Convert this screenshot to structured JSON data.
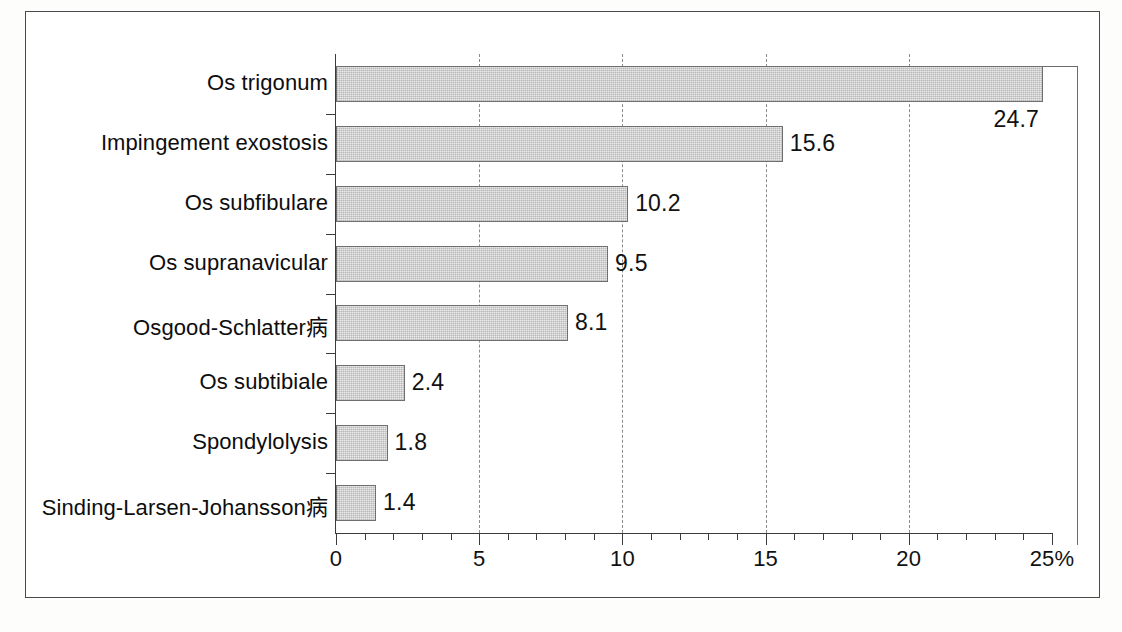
{
  "chart_data": {
    "type": "bar",
    "orientation": "horizontal",
    "title": "",
    "xlabel": "",
    "ylabel": "",
    "xlim": [
      0,
      25
    ],
    "grid": true,
    "gridlines_at": [
      5,
      10,
      15,
      20
    ],
    "legend": "none",
    "axis_unit_suffix": "%",
    "tick_labels": [
      "0",
      "5",
      "10",
      "15",
      "20",
      "25%"
    ],
    "tick_values": [
      0,
      5,
      10,
      15,
      20,
      25
    ],
    "minor_tick_step": 1,
    "categories": [
      "Os trigonum",
      "Impingement exostosis",
      "Os subfibulare",
      "Os supranavicular",
      "Osgood-Schlatter病",
      "Os subtibiale",
      "Spondylolysis",
      "Sinding-Larsen-Johansson病"
    ],
    "values": [
      24.7,
      15.6,
      10.2,
      9.5,
      8.1,
      2.4,
      1.8,
      1.4
    ],
    "value_labels": [
      "24.7",
      "15.6",
      "10.2",
      "9.5",
      "8.1",
      "2.4",
      "1.8",
      "1.4"
    ],
    "value_label_placement": [
      "below-right-of-bar-end",
      "right-of-bar-end",
      "right-of-bar-end",
      "right-of-bar-end",
      "right-of-bar-end",
      "right-of-bar-end",
      "right-of-bar-end",
      "right-of-bar-end"
    ]
  },
  "style": {
    "bar_fill": "#eaeaea",
    "bar_border": "#6f6f6f",
    "axis_color": "#3b3b3b",
    "gridline_color": "#8c8c8c",
    "text_color": "#111111",
    "frame_color": "#4a4a4a",
    "page_background": "#fdfdfc"
  }
}
